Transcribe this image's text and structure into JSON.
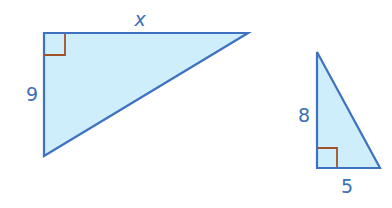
{
  "colors": {
    "stroke": "#3e72c0",
    "fill": "#cdeefa",
    "right_angle": "#a0522d",
    "label": "#3b6fb6"
  },
  "triangles": [
    {
      "id": "large",
      "vertices": [
        [
          44,
          33
        ],
        [
          248,
          33
        ],
        [
          44,
          156
        ]
      ],
      "right_angle_at": [
        44,
        33
      ],
      "labels": [
        {
          "text": "x",
          "side": "top",
          "x": 140,
          "y": 26
        },
        {
          "text": "9",
          "side": "left",
          "x": 24,
          "y": 100
        }
      ]
    },
    {
      "id": "small",
      "vertices": [
        [
          317,
          52
        ],
        [
          317,
          168
        ],
        [
          380,
          168
        ]
      ],
      "right_angle_at": [
        317,
        168
      ],
      "labels": [
        {
          "text": "8",
          "side": "left",
          "x": 297,
          "y": 120
        },
        {
          "text": "5",
          "side": "bottom",
          "x": 341,
          "y": 193
        }
      ]
    }
  ]
}
